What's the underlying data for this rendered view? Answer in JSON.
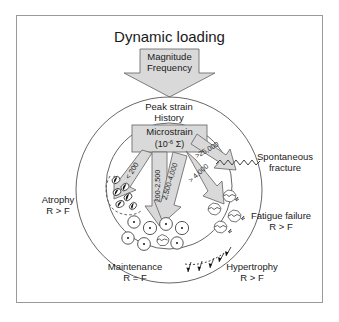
{
  "diagram": {
    "title": "Dynamic loading",
    "input_arrow": {
      "line1": "Magnitude",
      "line2": "Frequency"
    },
    "peak_strain": {
      "line1": "Peak strain",
      "line2": "History"
    },
    "microstrain_box": {
      "line1": "Microstrain",
      "base": "(10",
      "exponent": "-6",
      "symbol": " Σ)"
    },
    "strain_ranges": [
      {
        "id": "atrophy-range",
        "label": "< 200"
      },
      {
        "id": "maintenance-range",
        "label": "200-2,500"
      },
      {
        "id": "hypertrophy-range",
        "label": "2,500-4,000"
      },
      {
        "id": "fatigue-range",
        "label": "> 4,000"
      },
      {
        "id": "fracture-range",
        "label": ">25,000"
      }
    ],
    "outcomes": [
      {
        "id": "atrophy",
        "name": "Atrophy",
        "relation": "R > F"
      },
      {
        "id": "maintenance",
        "name": "Maintenance",
        "relation": "R = F"
      },
      {
        "id": "hypertrophy",
        "name": "Hypertrophy",
        "relation": "R > F"
      },
      {
        "id": "fatigue-failure",
        "name": "Fatigue failure",
        "relation": "R > F"
      },
      {
        "id": "spontaneous-fracture",
        "line1": "Spontaneous",
        "line2": "fracture"
      }
    ],
    "colors": {
      "arrow_fill": "#d9d9d9",
      "arrow_stroke": "#6f6f6f",
      "outline": "#555555",
      "text": "#1a1a1a",
      "frame": "#9a9a9a"
    }
  }
}
